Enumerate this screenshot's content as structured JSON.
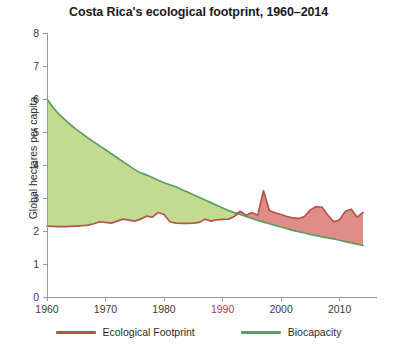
{
  "chart_data": {
    "type": "area",
    "title": "Costa Rica's ecological footprint, 1960–2014",
    "xlabel": "",
    "ylabel": "Global hectares per capita",
    "xlim": [
      1960,
      2014
    ],
    "ylim": [
      0,
      8
    ],
    "grid": false,
    "legend_position": "bottom",
    "y_ticks": [
      "0",
      "1",
      "2",
      "3",
      "4",
      "5",
      "6",
      "7",
      "8"
    ],
    "x_ticks": [
      "1960",
      "1970",
      "1980",
      "1990",
      "2000",
      "2010"
    ],
    "highlighted_x_tick": "1990",
    "x": [
      1960,
      1961,
      1962,
      1963,
      1964,
      1965,
      1966,
      1967,
      1968,
      1969,
      1970,
      1971,
      1972,
      1973,
      1974,
      1975,
      1976,
      1977,
      1978,
      1979,
      1980,
      1981,
      1982,
      1983,
      1984,
      1985,
      1986,
      1987,
      1988,
      1989,
      1990,
      1991,
      1992,
      1993,
      1994,
      1995,
      1996,
      1997,
      1998,
      1999,
      2000,
      2001,
      2002,
      2003,
      2004,
      2005,
      2006,
      2007,
      2008,
      2009,
      2010,
      2011,
      2012,
      2013,
      2014
    ],
    "series": [
      {
        "name": "Biocapacity",
        "color": "#5b9e62",
        "fill": "#c2dc8f",
        "values": [
          6.0,
          5.75,
          5.55,
          5.38,
          5.22,
          5.08,
          4.95,
          4.82,
          4.7,
          4.58,
          4.46,
          4.34,
          4.22,
          4.1,
          3.98,
          3.86,
          3.76,
          3.7,
          3.62,
          3.54,
          3.46,
          3.4,
          3.34,
          3.26,
          3.18,
          3.1,
          3.02,
          2.94,
          2.86,
          2.78,
          2.7,
          2.62,
          2.56,
          2.5,
          2.44,
          2.38,
          2.32,
          2.27,
          2.22,
          2.17,
          2.12,
          2.07,
          2.02,
          1.98,
          1.94,
          1.9,
          1.86,
          1.82,
          1.79,
          1.76,
          1.72,
          1.68,
          1.64,
          1.6,
          1.56
        ]
      },
      {
        "name": "Ecological Footprint",
        "color": "#b5534f",
        "fill": "#e08d8a",
        "values": [
          2.15,
          2.14,
          2.13,
          2.13,
          2.14,
          2.15,
          2.16,
          2.18,
          2.22,
          2.28,
          2.26,
          2.24,
          2.3,
          2.36,
          2.33,
          2.3,
          2.36,
          2.45,
          2.42,
          2.56,
          2.5,
          2.28,
          2.24,
          2.23,
          2.23,
          2.24,
          2.26,
          2.36,
          2.3,
          2.34,
          2.35,
          2.36,
          2.44,
          2.6,
          2.48,
          2.56,
          2.48,
          3.22,
          2.62,
          2.55,
          2.5,
          2.44,
          2.4,
          2.38,
          2.44,
          2.64,
          2.74,
          2.72,
          2.48,
          2.28,
          2.34,
          2.6,
          2.66,
          2.42,
          2.56
        ]
      }
    ]
  },
  "legend": {
    "items": [
      {
        "label": "Ecological Footprint",
        "color": "#b5534f"
      },
      {
        "label": "Biocapacity",
        "color": "#5b9e62"
      }
    ]
  }
}
